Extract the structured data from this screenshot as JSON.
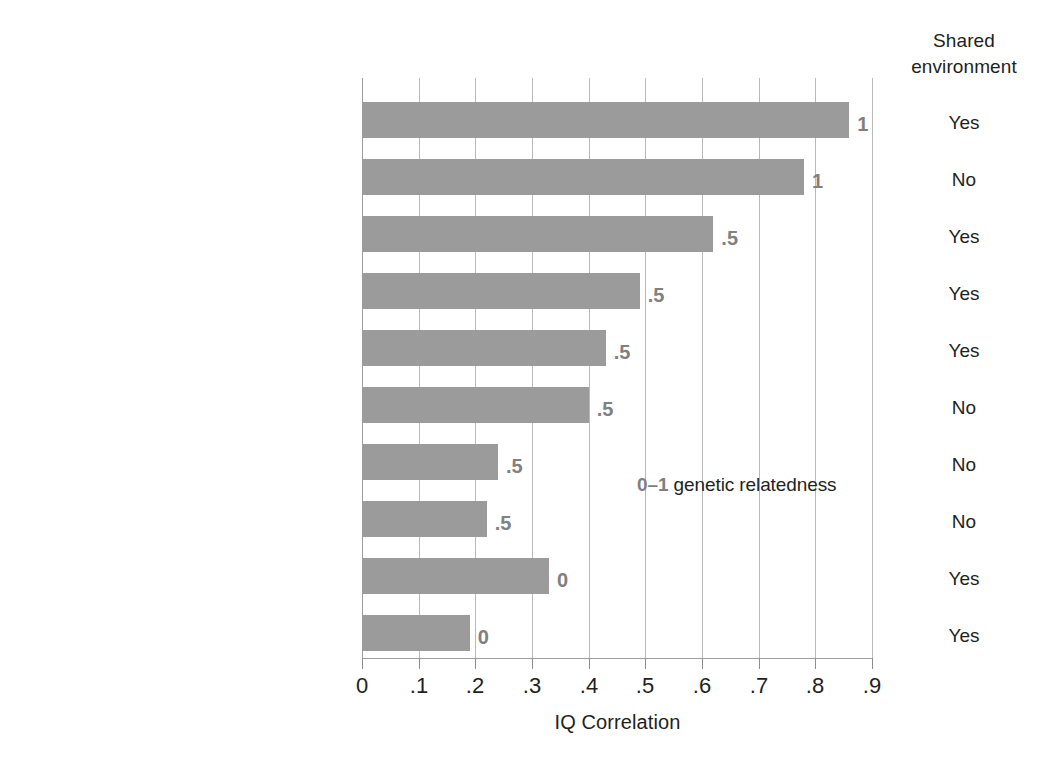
{
  "chart_data": {
    "type": "bar",
    "orientation": "horizontal",
    "title": "",
    "xlabel": "IQ Correlation",
    "ylabel": "",
    "xlim": [
      0,
      0.9
    ],
    "xticks": [
      "0",
      ".1",
      ".2",
      ".3",
      ".4",
      ".5",
      ".6",
      ".7",
      ".8",
      ".9"
    ],
    "xtick_values": [
      0,
      0.1,
      0.2,
      0.3,
      0.4,
      0.5,
      0.6,
      0.7,
      0.8,
      0.9
    ],
    "grid": true,
    "legend": "none",
    "bar_color": "#9b9b9b",
    "categories": [
      "Monozygotic twins (reared together)",
      "Monozygotic twins (reared apart)",
      "Dizygotic twins (reared together)",
      "Siblings (reared together)",
      "Parent-offspring (reared together)",
      "Dizygotic twins (reared apart)",
      "Siblings (reared apart)",
      "Parent-offspring (reared apart)",
      "Siblings (adopted)",
      "Parent-offspring (adopted)"
    ],
    "values": [
      0.86,
      0.78,
      0.62,
      0.49,
      0.43,
      0.4,
      0.24,
      0.22,
      0.33,
      0.19
    ],
    "bar_labels": [
      "1",
      "1",
      ".5",
      ".5",
      ".5",
      ".5",
      ".5",
      ".5",
      "0",
      "0"
    ],
    "annotations": [
      {
        "key": "0",
        "dash": "–1",
        "text": " genetic relatedness"
      }
    ],
    "extra_column": {
      "header_lines": [
        "Shared",
        "environment"
      ],
      "values": [
        "Yes",
        "No",
        "Yes",
        "Yes",
        "Yes",
        "No",
        "No",
        "No",
        "Yes",
        "Yes"
      ]
    }
  }
}
